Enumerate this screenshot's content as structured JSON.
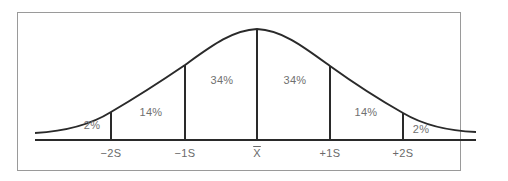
{
  "diagram": {
    "type": "normal-distribution",
    "axis_labels": [
      {
        "id": "minus2s",
        "text": "−2S",
        "x": 111
      },
      {
        "id": "minus1s",
        "text": "−1S",
        "x": 185
      },
      {
        "id": "mean",
        "text": "X",
        "x": 257
      },
      {
        "id": "plus1s",
        "text": "+1S",
        "x": 330
      },
      {
        "id": "plus2s",
        "text": "+2S",
        "x": 403
      }
    ],
    "regions": [
      {
        "id": "left-tail",
        "text": "2%",
        "x": 92,
        "y": 126
      },
      {
        "id": "left-14",
        "text": "14%",
        "x": 151,
        "y": 108
      },
      {
        "id": "left-34",
        "text": "34%",
        "x": 222,
        "y": 76
      },
      {
        "id": "right-34",
        "text": "34%",
        "x": 295,
        "y": 76
      },
      {
        "id": "right-14",
        "text": "14%",
        "x": 366,
        "y": 108
      },
      {
        "id": "right-tail",
        "text": "2%",
        "x": 421,
        "y": 124
      }
    ],
    "colors": {
      "line": "#2a2a2a",
      "text": "#6a6a6a",
      "frame": "#9a9a9a"
    }
  }
}
